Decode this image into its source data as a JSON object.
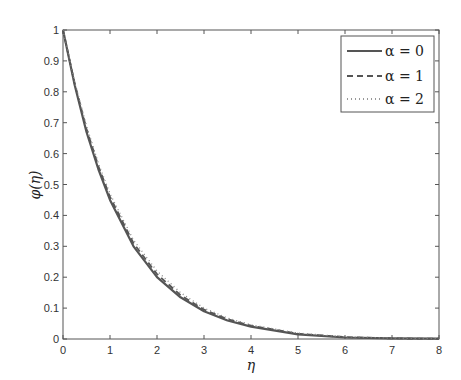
{
  "chart_data": {
    "type": "line",
    "title": "",
    "xlabel": "η",
    "ylabel": "φ(η)",
    "xlim": [
      0,
      8
    ],
    "ylim": [
      0,
      1
    ],
    "xticks": [
      0,
      1,
      2,
      3,
      4,
      5,
      6,
      7,
      8
    ],
    "yticks": [
      0,
      0.1,
      0.2,
      0.3,
      0.4,
      0.5,
      0.6,
      0.7,
      0.8,
      0.9,
      1
    ],
    "grid": false,
    "legend_position": "upper right",
    "x": [
      0,
      0.25,
      0.5,
      0.75,
      1,
      1.5,
      2,
      2.5,
      3,
      3.5,
      4,
      5,
      6,
      7,
      8
    ],
    "series": [
      {
        "name": "α = 0",
        "style": "solid",
        "values": [
          1,
          0.82,
          0.67,
          0.55,
          0.45,
          0.3,
          0.2,
          0.135,
          0.09,
          0.06,
          0.04,
          0.015,
          0.005,
          0.002,
          0.001
        ]
      },
      {
        "name": "α = 1",
        "style": "dashed",
        "values": [
          1,
          0.825,
          0.68,
          0.56,
          0.46,
          0.31,
          0.21,
          0.142,
          0.095,
          0.064,
          0.043,
          0.017,
          0.006,
          0.002,
          0.001
        ]
      },
      {
        "name": "α = 2",
        "style": "dotted",
        "values": [
          1,
          0.83,
          0.69,
          0.57,
          0.47,
          0.32,
          0.22,
          0.15,
          0.1,
          0.068,
          0.046,
          0.019,
          0.007,
          0.003,
          0.001
        ]
      }
    ]
  },
  "legend": {
    "items": [
      {
        "label": "α = 0",
        "style": "solid"
      },
      {
        "label": "α = 1",
        "style": "dashed"
      },
      {
        "label": "α = 2",
        "style": "dotted"
      }
    ]
  },
  "axes": {
    "xlabel": "η",
    "ylabel": "φ(η)"
  }
}
